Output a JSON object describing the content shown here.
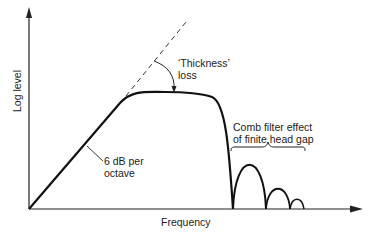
{
  "axes": {
    "x_label": "Frequency",
    "y_label": "Log level"
  },
  "annotations": {
    "slope_line1": "6 dB per",
    "slope_line2": "octave",
    "thickness_line1": "‘Thickness’",
    "thickness_line2": "loss",
    "comb_line1": "Comb filter effect",
    "comb_line2": "of finite head gap"
  },
  "colors": {
    "curve": "#111111",
    "axis": "#222222",
    "background": "#ffffff"
  }
}
